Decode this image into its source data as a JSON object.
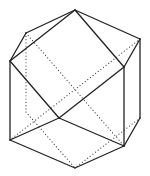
{
  "diagram": {
    "type": "polyhedron-line-drawing",
    "colors": {
      "background": "#ffffff",
      "visible_edge": "#222222",
      "hidden_edge": "#333333"
    },
    "vertices": {
      "top": [
        75,
        10
      ],
      "upper_left": [
        26,
        33
      ],
      "left_top": [
        10,
        61
      ],
      "left_bottom": [
        10,
        140
      ],
      "right_top": [
        140,
        39
      ],
      "right_inner": [
        124,
        67
      ],
      "right_bottom": [
        140,
        118
      ],
      "bottom_right": [
        124,
        146
      ],
      "bottom": [
        75,
        168
      ],
      "center_low": [
        59,
        118
      ],
      "hidden_left_low": [
        26,
        112
      ]
    },
    "visible_edges": [
      [
        "top",
        "upper_left"
      ],
      [
        "upper_left",
        "left_top"
      ],
      [
        "top",
        "left_top"
      ],
      [
        "top",
        "right_top"
      ],
      [
        "top",
        "right_inner"
      ],
      [
        "right_top",
        "right_inner"
      ],
      [
        "right_top",
        "right_bottom"
      ],
      [
        "right_inner",
        "bottom_right"
      ],
      [
        "right_bottom",
        "bottom_right"
      ],
      [
        "left_top",
        "left_bottom"
      ],
      [
        "left_top",
        "center_low"
      ],
      [
        "right_inner",
        "center_low"
      ],
      [
        "center_low",
        "left_bottom"
      ],
      [
        "center_low",
        "bottom_right"
      ],
      [
        "left_bottom",
        "bottom"
      ],
      [
        "bottom",
        "bottom_right"
      ]
    ],
    "hidden_edges": [
      [
        "upper_left",
        "hidden_left_low"
      ],
      [
        "hidden_left_low",
        "bottom"
      ],
      [
        "upper_left",
        "bottom_right"
      ],
      [
        "right_top",
        "left_bottom"
      ],
      [
        "right_bottom",
        "bottom"
      ]
    ]
  }
}
